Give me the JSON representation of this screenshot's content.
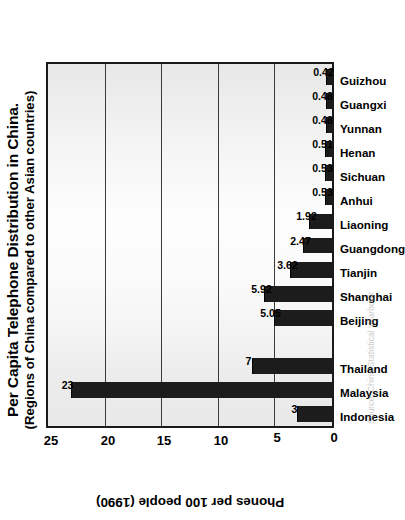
{
  "chart_data": {
    "type": "bar",
    "title": "Per Capita Telephone Distribution in China.",
    "subtitle": "(Regions of China compared to other Asian countries)",
    "xlabel": "",
    "ylabel": "Phones per 100 people (1990)",
    "ylim": [
      0,
      25
    ],
    "y_ticks": [
      0,
      5,
      10,
      15,
      20,
      25
    ],
    "grid": true,
    "legend": "none",
    "orientation": "vertical-bars-rotated-90ccw",
    "bar_color": "#1c1c1c",
    "plot_background": "#f0f0f0",
    "categories": [
      "Indonesia",
      "Malaysia",
      "Thailand",
      "",
      "Beijing",
      "Shanghai",
      "Tianjin",
      "Guangdong",
      "Liaoning",
      "Anhui",
      "Sichuan",
      "Henan",
      "Yunnan",
      "Guangxi",
      "Guizhou"
    ],
    "values": [
      3,
      23,
      7,
      null,
      5.05,
      5.92,
      3.62,
      2.47,
      1.92,
      0.53,
      0.53,
      0.51,
      0.48,
      0.48,
      0.42
    ],
    "value_labels": [
      "3",
      "23",
      "7",
      "",
      "5.05",
      "5.92",
      "3.62",
      "2.47",
      "1.92",
      "0.53",
      "0.53",
      "0.51",
      "0.48",
      "0.48",
      "0.42"
    ],
    "groups": [
      {
        "name": "Other Asian countries",
        "categories": [
          "Indonesia",
          "Malaysia",
          "Thailand"
        ]
      },
      {
        "name": "Regions of China",
        "categories": [
          "Beijing",
          "Shanghai",
          "Tianjin",
          "Guangdong",
          "Liaoning",
          "Anhui",
          "Sichuan",
          "Henan",
          "Yunnan",
          "Guangxi",
          "Guizhou"
        ]
      }
    ]
  },
  "source_note": "Source: China Statistical Yearbook"
}
